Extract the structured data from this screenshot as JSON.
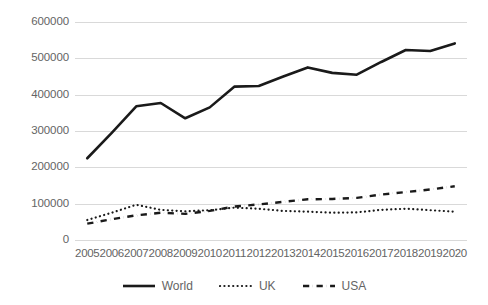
{
  "chart_data": {
    "type": "line",
    "title": "",
    "xlabel": "",
    "ylabel": "",
    "categories": [
      "2005",
      "2006",
      "2007",
      "2008",
      "2009",
      "2010",
      "2011",
      "2012",
      "2013",
      "2014",
      "2015",
      "2016",
      "2017",
      "2018",
      "2019",
      "2020"
    ],
    "ylim": [
      0,
      600000
    ],
    "yticks": [
      0,
      100000,
      200000,
      300000,
      400000,
      500000,
      600000
    ],
    "ytick_labels": [
      "0",
      "100000",
      "200000",
      "300000",
      "400000",
      "500000",
      "600000"
    ],
    "grid": true,
    "legend_position": "bottom",
    "series": [
      {
        "name": "World",
        "style": "solid",
        "color": "#1a1a1a",
        "width": 2.6,
        "values": [
          225000,
          295000,
          368000,
          377000,
          335000,
          365000,
          422000,
          424000,
          450000,
          475000,
          460000,
          455000,
          490000,
          523000,
          520000,
          541000
        ]
      },
      {
        "name": "UK",
        "style": "dotted",
        "color": "#1a1a1a",
        "width": 2.2,
        "values": [
          55000,
          75000,
          97000,
          83000,
          79000,
          82000,
          89000,
          86000,
          80000,
          78000,
          75000,
          76000,
          83000,
          86000,
          82000,
          78000
        ]
      },
      {
        "name": "USA",
        "style": "dashdot",
        "color": "#1a1a1a",
        "width": 2.4,
        "values": [
          45000,
          57000,
          68000,
          75000,
          72000,
          80000,
          92000,
          98000,
          105000,
          112000,
          113000,
          116000,
          125000,
          132000,
          139000,
          148000
        ]
      }
    ]
  },
  "legend": {
    "items": [
      {
        "label": "World",
        "icon": "solid-line-swatch"
      },
      {
        "label": "UK",
        "icon": "dotted-line-swatch"
      },
      {
        "label": "USA",
        "icon": "dashdot-line-swatch"
      }
    ]
  },
  "colors": {
    "gridline": "#d9d9d9",
    "tick_label": "#646464",
    "series_line": "#1a1a1a",
    "background": "#ffffff"
  }
}
